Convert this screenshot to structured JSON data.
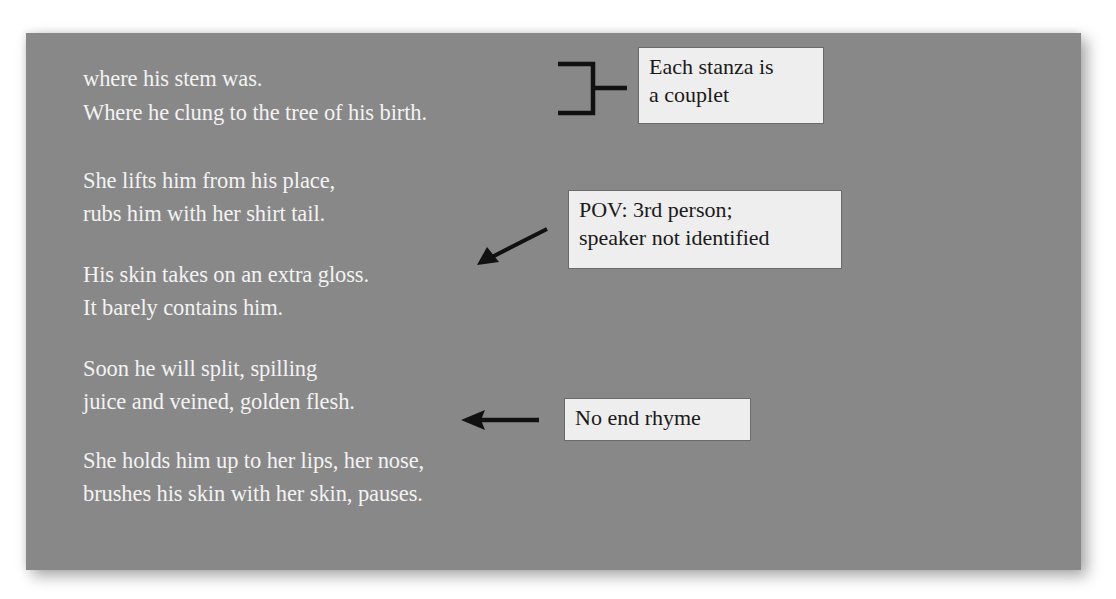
{
  "poem": {
    "stanzas": [
      {
        "lines": [
          "where his stem was.",
          "Where he clung to the tree of his birth."
        ]
      },
      {
        "lines": [
          "She lifts him from his place,",
          "rubs him with her shirt tail."
        ]
      },
      {
        "lines": [
          "His skin takes on an extra gloss.",
          "It barely contains him."
        ]
      },
      {
        "lines": [
          "Soon he will split, spilling",
          "juice and veined, golden flesh."
        ]
      },
      {
        "lines": [
          "She holds him up to her lips, her nose,",
          "brushes his skin with her skin, pauses."
        ]
      }
    ]
  },
  "annotations": {
    "stanza_form": {
      "lines": [
        "Each stanza is",
        "a couplet"
      ],
      "pointer": "bracket"
    },
    "point_of_view": {
      "lines": [
        "POV: 3rd person;",
        "speaker not identified"
      ],
      "pointer": "diagonal-arrow"
    },
    "rhyme": {
      "lines": [
        "No end rhyme"
      ],
      "pointer": "left-arrow"
    }
  },
  "colors": {
    "card_background": "#888888",
    "poem_text": "#f3f3f3",
    "note_background": "#eeeeee",
    "note_text": "#1a1a1a",
    "pointer": "#111111"
  }
}
